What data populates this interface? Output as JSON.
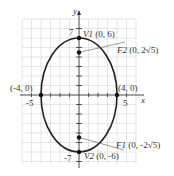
{
  "diagram": {
    "type": "ellipse",
    "equation_params": {
      "a": 6,
      "b": 4,
      "c_expr": "2√5"
    },
    "axes": {
      "x_label": "x",
      "y_label": "y",
      "x_tick_labels": [
        "-5",
        "5"
      ],
      "y_tick_labels": [
        "7",
        "-7"
      ]
    },
    "points": {
      "v1": {
        "name": "V1",
        "coords": "(0, 6)"
      },
      "v2": {
        "name": "V2",
        "coords": "(0, -6)"
      },
      "f2": {
        "name": "F2",
        "coords": "(0, 2√5)"
      },
      "f1": {
        "name": "F1",
        "coords": "(0, -2√5)"
      },
      "left": {
        "coords": "(-4, 0)"
      },
      "right": {
        "coords": "(4, 0)"
      }
    },
    "colors": {
      "grid": "#cfcfcf",
      "curve": "#222222",
      "axis": "#333333"
    }
  }
}
